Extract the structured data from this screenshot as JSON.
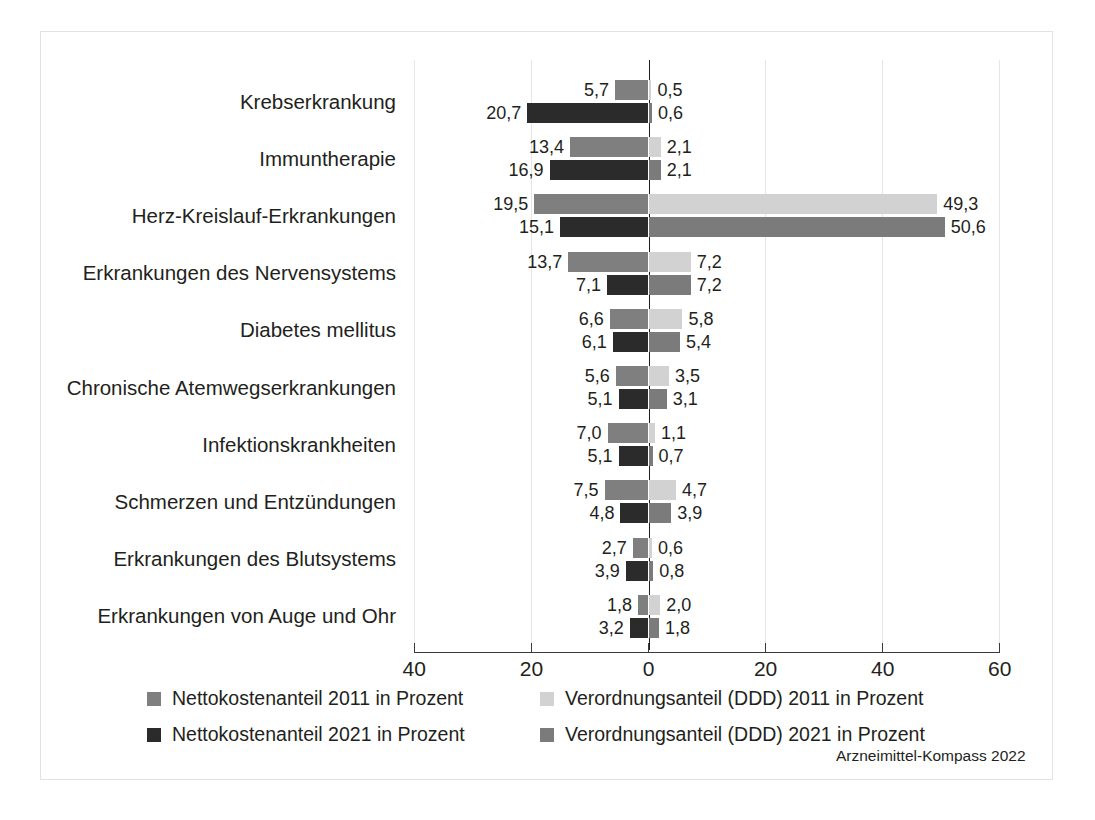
{
  "figure": {
    "source_note": "Arzneimittel-Kompass 2022",
    "frame_color": "#e3e3e3"
  },
  "chart_data": {
    "type": "bar",
    "orientation": "horizontal",
    "layout": "diverging-paired",
    "title": "",
    "subtitle": "",
    "xlabel": "",
    "ylabel": "",
    "grid": true,
    "legend_position": "bottom",
    "xlim": [
      -40,
      60
    ],
    "xticks": [
      -40,
      -20,
      0,
      20,
      40,
      60
    ],
    "xticklabels": [
      "40",
      "20",
      "0",
      "20",
      "40",
      "60"
    ],
    "decimal_separator": ",",
    "categories": [
      "Krebserkrankung",
      "Immuntherapie",
      "Herz-Kreislauf-Erkrankungen",
      "Erkrankungen des Nervensystems",
      "Diabetes mellitus",
      "Chronische Atemwegserkrankungen",
      "Infektionskrankheiten",
      "Schmerzen und Entzündungen",
      "Erkrankungen des Blutsystems",
      "Erkrankungen von Auge und Ohr"
    ],
    "series": [
      {
        "name": "Nettokostenanteil 2011 in Prozent",
        "side": "left",
        "row": "upper",
        "color": "#7f7f7f",
        "values": [
          5.7,
          13.4,
          19.5,
          13.7,
          6.6,
          5.6,
          7.0,
          7.5,
          2.7,
          1.8
        ],
        "labels": [
          "5,7",
          "13,4",
          "19,5",
          "13,7",
          "6,6",
          "5,6",
          "7,0",
          "7,5",
          "2,7",
          "1,8"
        ]
      },
      {
        "name": "Nettokostenanteil 2021 in Prozent",
        "side": "left",
        "row": "lower",
        "color": "#2b2b2b",
        "values": [
          20.7,
          16.9,
          15.1,
          7.1,
          6.1,
          5.1,
          5.1,
          4.8,
          3.9,
          3.2
        ],
        "labels": [
          "20,7",
          "16,9",
          "15,1",
          "7,1",
          "6,1",
          "5,1",
          "5,1",
          "4,8",
          "3,9",
          "3,2"
        ]
      },
      {
        "name": "Verordnungsanteil (DDD) 2011 in Prozent",
        "side": "right",
        "row": "upper",
        "color": "#d2d2d2",
        "values": [
          0.5,
          2.1,
          49.3,
          7.2,
          5.8,
          3.5,
          1.1,
          4.7,
          0.6,
          2.0
        ],
        "labels": [
          "0,5",
          "2,1",
          "49,3",
          "7,2",
          "5,8",
          "3,5",
          "1,1",
          "4,7",
          "0,6",
          "2,0"
        ]
      },
      {
        "name": "Verordnungsanteil (DDD) 2021 in Prozent",
        "side": "right",
        "row": "lower",
        "color": "#7b7b7b",
        "values": [
          0.6,
          2.1,
          50.6,
          7.2,
          5.4,
          3.1,
          0.7,
          3.9,
          0.8,
          1.8
        ],
        "labels": [
          "0,6",
          "2,1",
          "50,6",
          "7,2",
          "5,4",
          "3,1",
          "0,7",
          "3,9",
          "0,8",
          "1,8"
        ]
      }
    ]
  },
  "legend": {
    "entries": [
      {
        "label": "Nettokostenanteil 2011 in Prozent",
        "color": "#7f7f7f"
      },
      {
        "label": "Nettokostenanteil 2021 in Prozent",
        "color": "#2b2b2b"
      },
      {
        "label": "Verordnungsanteil (DDD) 2011 in Prozent",
        "color": "#d2d2d2"
      },
      {
        "label": "Verordnungsanteil (DDD) 2021 in Prozent",
        "color": "#7b7b7b"
      }
    ]
  }
}
